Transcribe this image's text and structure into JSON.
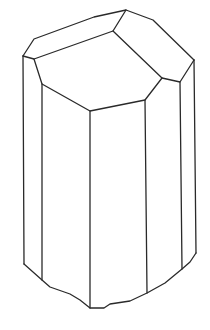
{
  "diagram": {
    "line_color": "#2a2a2a",
    "background": "#ffffff",
    "faces": {
      "top_outer_outline": [
        [
          23,
          56
        ],
        [
          34,
          39
        ],
        [
          94,
          17
        ],
        [
          126,
          10
        ],
        [
          153,
          20
        ],
        [
          194,
          60
        ]
      ],
      "top_face": [
        [
          34,
          59
        ],
        [
          113,
          31
        ],
        [
          162,
          78
        ],
        [
          145,
          100
        ],
        [
          90,
          111
        ],
        [
          42,
          84
        ]
      ],
      "left_bevel": [
        [
          23,
          56
        ],
        [
          34,
          59
        ]
      ],
      "top_left_bevel": [
        [
          113,
          31
        ],
        [
          126,
          10
        ]
      ],
      "right_bevel": [
        [
          162,
          78
        ],
        [
          180,
          82
        ],
        [
          194,
          60
        ]
      ],
      "vertical_edges": [
        {
          "x1": 23,
          "y1": 56,
          "x2": 24,
          "y2": 264
        },
        {
          "x1": 42,
          "y1": 84,
          "x2": 42,
          "y2": 280
        },
        {
          "x1": 90,
          "y1": 111,
          "x2": 90,
          "y2": 308
        },
        {
          "x1": 145,
          "y1": 100,
          "x2": 147,
          "y2": 293
        },
        {
          "x1": 180,
          "y1": 82,
          "x2": 182,
          "y2": 269
        },
        {
          "x1": 194,
          "y1": 60,
          "x2": 196,
          "y2": 253
        }
      ],
      "bottom_outline": [
        [
          24,
          264
        ],
        [
          42,
          280
        ],
        [
          50,
          287
        ],
        [
          70,
          294
        ],
        [
          80,
          300
        ],
        [
          90,
          308
        ],
        [
          104,
          308
        ],
        [
          110,
          304
        ],
        [
          130,
          301
        ],
        [
          147,
          293
        ],
        [
          165,
          283
        ],
        [
          182,
          269
        ],
        [
          190,
          262
        ],
        [
          196,
          253
        ]
      ]
    }
  }
}
